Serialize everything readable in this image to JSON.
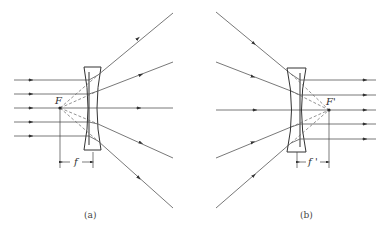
{
  "figure": {
    "panel_a": {
      "caption": "(a)",
      "focus_label": "F",
      "focal_label": "f",
      "description": "Parallel rays entering a diverging (concave) lens diverge as if from the front focal point F"
    },
    "panel_b": {
      "caption": "(b)",
      "focus_label": "F'",
      "focal_label": "f '",
      "description": "Rays converging toward the rear focal point F' emerge parallel after a diverging (concave) lens"
    },
    "colors": {
      "line": "#555555",
      "background": "#ffffff"
    }
  }
}
